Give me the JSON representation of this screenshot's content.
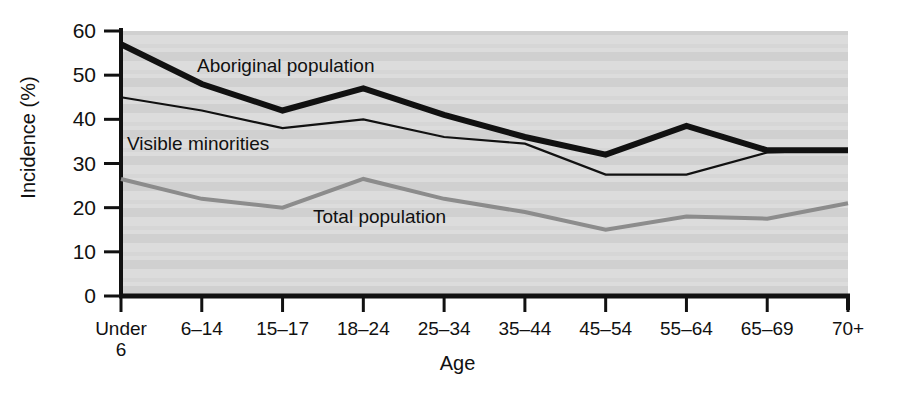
{
  "chart_data": {
    "type": "line",
    "title": "",
    "xlabel": "Age",
    "ylabel": "Incidence (%)",
    "categories": [
      "Under 6",
      "6–14",
      "15–17",
      "18–24",
      "25–34",
      "35–44",
      "45–54",
      "55–64",
      "65–69",
      "70+"
    ],
    "ylim": [
      0,
      60
    ],
    "yticks": [
      0,
      10,
      20,
      30,
      40,
      50,
      60
    ],
    "ytick_labels": [
      "0",
      "10",
      "20",
      "30",
      "40",
      "50",
      "60"
    ],
    "grid": false,
    "legend_position": "inline-annotations",
    "series": [
      {
        "name": "Aboriginal population",
        "color": "#111111",
        "width": 6,
        "values": [
          57,
          48,
          42,
          47,
          41,
          36,
          32,
          38.5,
          33,
          33
        ]
      },
      {
        "name": "Visible minorities",
        "color": "#111111",
        "width": 2.2,
        "values": [
          45,
          42,
          38,
          40,
          36,
          34.5,
          27.5,
          27.5,
          32.5,
          33
        ]
      },
      {
        "name": "Total population",
        "color": "#8c8c8c",
        "width": 4,
        "values": [
          26.5,
          22,
          20,
          26.5,
          22,
          19,
          15,
          18,
          17.5,
          21
        ]
      }
    ],
    "annotations": [
      {
        "text": "Aboriginal population",
        "x_px": 197,
        "y_px": 55
      },
      {
        "text": "Visible minorities",
        "x_px": 127,
        "y_px": 133
      },
      {
        "text": "Total population",
        "x_px": 313,
        "y_px": 206
      }
    ]
  }
}
